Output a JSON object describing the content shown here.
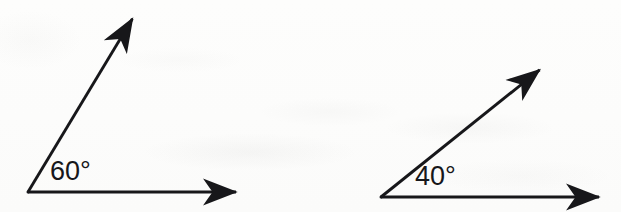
{
  "figure": {
    "background_color": "#fdfdfc",
    "ink_color": "#17171a",
    "width": 621,
    "height": 212,
    "angles": [
      {
        "id": "angle-60",
        "label": "60°",
        "measure": 60,
        "unit": "degrees",
        "vertex": {
          "x": 28,
          "y": 192
        },
        "rays": [
          {
            "name": "horizontal-ray",
            "from": {
              "x": 28,
              "y": 192
            },
            "to": {
              "x": 245,
              "y": 192
            },
            "arrowhead": true,
            "direction_deg": 0
          },
          {
            "name": "slanted-ray",
            "from": {
              "x": 28,
              "y": 192
            },
            "to": {
              "x": 139,
              "y": 10
            },
            "arrowhead": true,
            "direction_deg": 59
          }
        ],
        "label_position": {
          "x": 50,
          "y": 158
        }
      },
      {
        "id": "angle-40",
        "label": "40°",
        "measure": 40,
        "unit": "degrees",
        "vertex": {
          "x": 381,
          "y": 197
        },
        "rays": [
          {
            "name": "horizontal-ray",
            "from": {
              "x": 381,
              "y": 197
            },
            "to": {
              "x": 608,
              "y": 197
            },
            "arrowhead": true,
            "direction_deg": 0
          },
          {
            "name": "slanted-ray",
            "from": {
              "x": 381,
              "y": 197
            },
            "to": {
              "x": 548,
              "y": 62
            },
            "arrowhead": true,
            "direction_deg": 39
          }
        ],
        "label_position": {
          "x": 415,
          "y": 163
        }
      }
    ]
  }
}
